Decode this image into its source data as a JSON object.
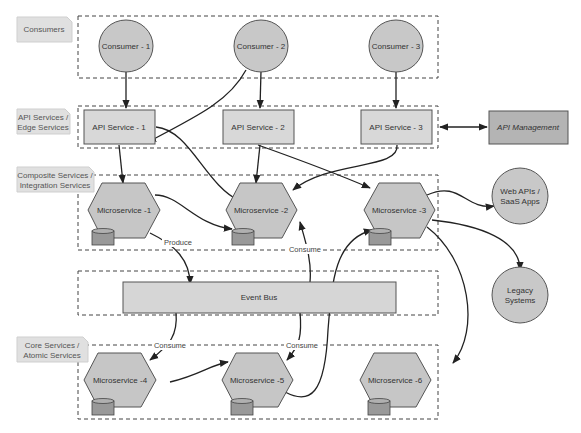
{
  "tiers": [
    {
      "id": "consumers",
      "label_lines": [
        "Consumers"
      ]
    },
    {
      "id": "api",
      "label_lines": [
        "API Services /",
        "Edge Services"
      ]
    },
    {
      "id": "composite",
      "label_lines": [
        "Composite Services /",
        "Integration Services"
      ]
    },
    {
      "id": "core",
      "label_lines": [
        "Core Services /",
        "Atomic Services"
      ]
    }
  ],
  "consumers": [
    "Consumer - 1",
    "Consumer - 2",
    "Consumer - 3"
  ],
  "api_services": [
    "API Service - 1",
    "API Service - 2",
    "API Service - 3"
  ],
  "api_management": "API Management",
  "microservices": [
    "Microservice -1",
    "Microservice -2",
    "Microservice -3",
    "Microservice -4",
    "Microservice -5",
    "Microservice -6"
  ],
  "event_bus": "Event Bus",
  "external": {
    "web_apis_lines": [
      "Web APIs /",
      "SaaS Apps"
    ],
    "legacy_lines": [
      "Legacy",
      "Systems"
    ]
  },
  "edge_labels": {
    "produce": "Produce",
    "consume_1": "Consume",
    "consume_2": "Consume",
    "consume_3": "Consume"
  },
  "colors": {
    "node_fill": "#c8c8c8",
    "management_fill": "#b4b4b4",
    "tier_label_fill": "#e0e0e0",
    "edge": "#222222"
  }
}
